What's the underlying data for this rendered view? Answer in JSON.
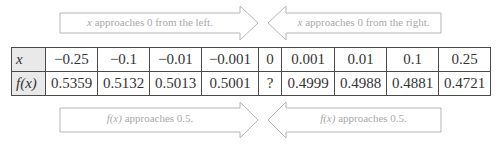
{
  "arrows": {
    "top_left": {
      "text_var": "x",
      "text_rest": " approaches 0 from the left.",
      "direction": "right"
    },
    "top_right": {
      "text_var": "x",
      "text_rest": " approaches 0 from the right.",
      "direction": "left"
    },
    "bottom_left": {
      "text_var": "f(x)",
      "text_rest": " approaches 0.5.",
      "direction": "right"
    },
    "bottom_right": {
      "text_var": "f(x)",
      "text_rest": " approaches 0.5.",
      "direction": "left"
    }
  },
  "table": {
    "row_headers": [
      "x",
      "f(x)"
    ],
    "x_values": [
      "−0.25",
      "−0.1",
      "−0.01",
      "−0.001",
      "0",
      "0.001",
      "0.01",
      "0.1",
      "0.25"
    ],
    "fx_values": [
      "0.5359",
      "0.5132",
      "0.5013",
      "0.5001",
      "?",
      "0.4999",
      "0.4988",
      "0.4881",
      "0.4721"
    ]
  },
  "colors": {
    "arrow_stroke": "#b5b5b5",
    "arrow_text": "#a9a9a9",
    "table_border": "#4a4a4a",
    "header_bg": "#e9e9e9"
  }
}
